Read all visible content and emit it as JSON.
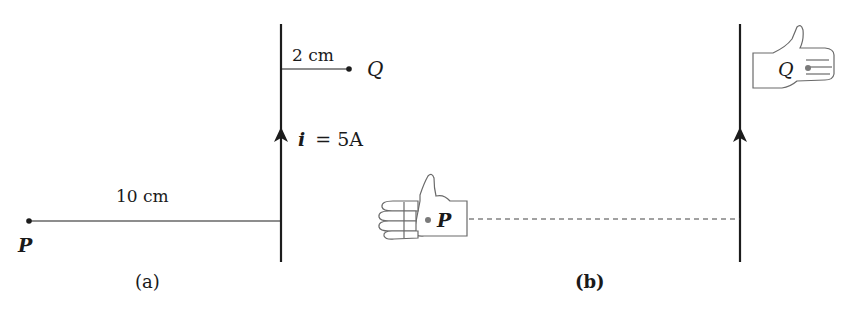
{
  "figure": {
    "colors": {
      "ink": "#1a1a1a",
      "wire": "#1c1c1c",
      "hand_outline": "#6a6a6a",
      "dot_gray": "#7a7a7a",
      "background": "#ffffff"
    },
    "panel_a": {
      "caption": "(a)",
      "current_label": "i = 5A",
      "current_symbol": "i",
      "current_value": "= 5A",
      "distance_q_label": "2 cm",
      "distance_p_label": "10 cm",
      "point_q_label": "Q",
      "point_p_label": "P",
      "current_direction": "up"
    },
    "panel_b": {
      "caption": "(b)",
      "point_q_label": "Q",
      "point_p_label": "P",
      "current_direction": "up",
      "hand_q": "right-hand-thumb-up-fingers-right",
      "hand_p": "right-hand-thumb-up-fingers-left"
    }
  }
}
